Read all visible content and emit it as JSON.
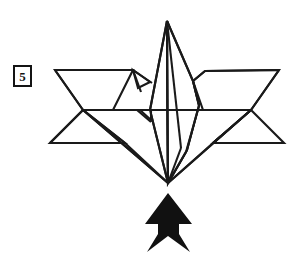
{
  "diagram": {
    "step_number": "5",
    "background_color": "#ffffff",
    "line_color": "#1a1a1a",
    "fill_color": "#ffffff",
    "arrow_color": "#111111",
    "canvas": {
      "width": 305,
      "height": 261
    },
    "arrow": {
      "name": "push-arrow",
      "direction": "up",
      "meaning": "push / fold upward",
      "tip_x": 168,
      "tip_y": 193,
      "tail_y": 252
    },
    "model": {
      "apex": {
        "x": 167,
        "y": 21
      },
      "bottom_point": {
        "x": 168,
        "y": 183
      },
      "left_wing_tip_top": {
        "x": 55,
        "y": 70
      },
      "right_wing_tip_top": {
        "x": 279,
        "y": 70
      },
      "left_wing_tip_bottom": {
        "x": 50,
        "y": 143
      },
      "right_wing_tip_bottom": {
        "x": 284,
        "y": 143
      },
      "center_left_edge_x": 150,
      "center_right_edge_x": 199,
      "mid_horizontal_y": 109
    }
  }
}
